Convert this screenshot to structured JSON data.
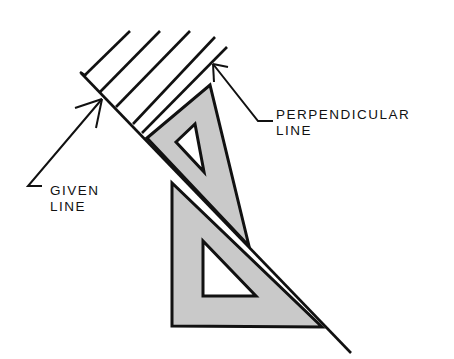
{
  "diagram": {
    "labels": {
      "perpendicular_line": [
        "PERPENDICULAR",
        "LINE"
      ],
      "given_line": [
        "GIVEN",
        "LINE"
      ]
    },
    "colors": {
      "stroke": "#111111",
      "triangle_fill": "#c9c9c9",
      "background": "#ffffff"
    },
    "elements": [
      {
        "id": "given-line",
        "type": "line"
      },
      {
        "id": "perpendicular-hatch-lines",
        "type": "line-set",
        "count": 5
      },
      {
        "id": "upper-triangle",
        "type": "30-60-triangle"
      },
      {
        "id": "lower-triangle",
        "type": "45-triangle"
      },
      {
        "id": "leader-perpendicular",
        "type": "arrow-leader"
      },
      {
        "id": "leader-given",
        "type": "arrow-leader"
      }
    ]
  }
}
